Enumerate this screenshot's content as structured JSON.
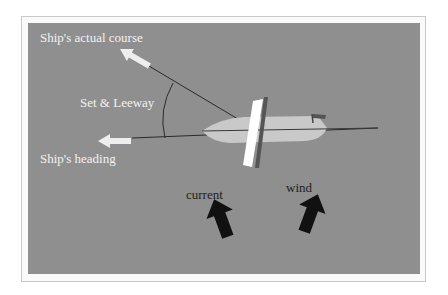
{
  "diagram": {
    "type": "navigation-vector-diagram",
    "labels": {
      "actual_course": "Ship's actual course",
      "set_leeway": "Set & Leeway",
      "heading": "Ship's heading",
      "current": "current",
      "wind": "wind"
    },
    "colors": {
      "background": "#8f8f8f",
      "frame": "#c8c8c8",
      "hull": "#c9c9c9",
      "sail": "#ffffff",
      "mast": "#555555",
      "arrow_light": "#eeeeee",
      "arrow_dark": "#111111",
      "line": "#2a2a2a"
    }
  }
}
